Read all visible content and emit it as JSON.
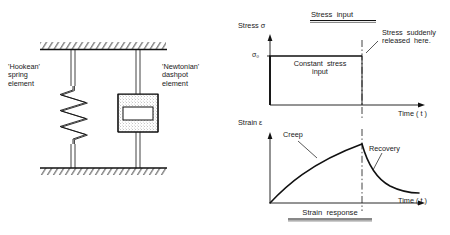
{
  "figure": {
    "left_diagram": {
      "name": "spring-dashpot-model",
      "spring_label": "'Hookean'\nspring\nelement",
      "dashpot_label": "'Newtonian'\ndashpot\nelement",
      "support_top": "fixed-hatched-support",
      "support_bottom": "fixed-hatched-support",
      "spring_coils": 7,
      "dashpot_fill": "viscous-fluid-stipple"
    },
    "charts": [
      {
        "id": "stress-input",
        "type": "line",
        "title": "Stress  input",
        "title_underlined": true,
        "ylabel": "Stress σ",
        "xlabel": "Time ( t )",
        "ytick_labels": [
          "σ₀"
        ],
        "annotation_inside": "Constant  stress\ninput",
        "annotation_outside": "Stress  suddenly\nreleased  here.",
        "grid": false,
        "legend": "none",
        "xlim": [
          0,
          1
        ],
        "ylim": [
          0,
          1
        ],
        "release_x": 0.62,
        "series": [
          {
            "name": "applied stress",
            "x": [
              0.0,
              0.0,
              0.62,
              0.62
            ],
            "y": [
              0.0,
              0.62,
              0.62,
              0.0
            ]
          }
        ],
        "markers": {
          "vertical_dash_dot_at_x": 0.62
        }
      },
      {
        "id": "strain-response",
        "type": "line",
        "title": "Strain  response",
        "title_underlined": true,
        "ylabel": "Strain ε",
        "xlabel": "Time ( t )",
        "ytick_labels": [],
        "annotation_creep": "Creep",
        "annotation_recovery": "Recovery",
        "grid": false,
        "legend": "none",
        "xlim": [
          0,
          1
        ],
        "ylim": [
          0,
          1
        ],
        "release_x": 0.62,
        "series": [
          {
            "name": "strain",
            "x": [
              0.0,
              0.06,
              0.13,
              0.2,
              0.27,
              0.34,
              0.41,
              0.48,
              0.55,
              0.62,
              0.62,
              0.66,
              0.7,
              0.74,
              0.78,
              0.83,
              0.88,
              0.94,
              1.0
            ],
            "y": [
              0.0,
              0.22,
              0.38,
              0.5,
              0.6,
              0.68,
              0.75,
              0.81,
              0.86,
              0.9,
              0.72,
              0.52,
              0.38,
              0.28,
              0.21,
              0.16,
              0.13,
              0.11,
              0.1
            ]
          }
        ],
        "markers": {
          "vertical_dash_dot_at_x": 0.62
        }
      }
    ]
  }
}
